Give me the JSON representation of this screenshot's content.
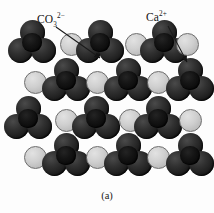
{
  "figure": {
    "caption": "(a)",
    "background_color": "#fdfdfd"
  },
  "labels": [
    {
      "id": "carbonate",
      "name": "CO3",
      "base": "CO",
      "subscript": "3",
      "superscript": "2−",
      "full_text": "CO₃²⁻",
      "x": 37,
      "y": 12
    },
    {
      "id": "calcium",
      "name": "Ca",
      "base": "Ca",
      "subscript": "",
      "superscript": "2+",
      "full_text": "Ca²⁺",
      "x": 146,
      "y": 10
    }
  ],
  "arrows": [
    {
      "id": "arrow-to-carbonate",
      "from_x": 56,
      "from_y": 27,
      "to_x": 100,
      "to_y": 58,
      "color": "#1a1a1a"
    },
    {
      "id": "arrow-to-calcium",
      "from_x": 168,
      "from_y": 26,
      "to_x": 187,
      "to_y": 62,
      "color": "#1a1a1a"
    }
  ],
  "legend_colors": {
    "carbonate_dark": "#1d1d1d",
    "calcium_light": "#cfcfcf",
    "calcium_outline": "#6d6d6d"
  },
  "chart_data": {
    "type": "diagram",
    "unit_radius_carbonate": 12.5,
    "unit_radius_calcium": 11.5,
    "rows": [
      {
        "row": 1,
        "y": 44,
        "items": [
          {
            "kind": "carbonate",
            "cx": 32
          },
          {
            "kind": "calcium",
            "cx": 71
          },
          {
            "kind": "carbonate",
            "cx": 100
          },
          {
            "kind": "calcium",
            "cx": 136
          },
          {
            "kind": "carbonate",
            "cx": 164
          },
          {
            "kind": "calcium",
            "cx": 187
          }
        ]
      },
      {
        "row": 2,
        "y": 82,
        "items": [
          {
            "kind": "calcium",
            "cx": 35
          },
          {
            "kind": "carbonate",
            "cx": 66
          },
          {
            "kind": "calcium",
            "cx": 97
          },
          {
            "kind": "carbonate",
            "cx": 128
          },
          {
            "kind": "calcium",
            "cx": 158
          },
          {
            "kind": "carbonate",
            "cx": 190
          }
        ]
      },
      {
        "row": 3,
        "y": 120,
        "items": [
          {
            "kind": "carbonate",
            "cx": 28
          },
          {
            "kind": "calcium",
            "cx": 66
          },
          {
            "kind": "carbonate",
            "cx": 96
          },
          {
            "kind": "calcium",
            "cx": 130
          },
          {
            "kind": "carbonate",
            "cx": 158
          },
          {
            "kind": "calcium",
            "cx": 190
          }
        ]
      },
      {
        "row": 4,
        "y": 157,
        "items": [
          {
            "kind": "calcium",
            "cx": 35
          },
          {
            "kind": "carbonate",
            "cx": 66
          },
          {
            "kind": "calcium",
            "cx": 97
          },
          {
            "kind": "carbonate",
            "cx": 128
          },
          {
            "kind": "calcium",
            "cx": 158
          },
          {
            "kind": "carbonate",
            "cx": 190
          }
        ]
      }
    ]
  }
}
